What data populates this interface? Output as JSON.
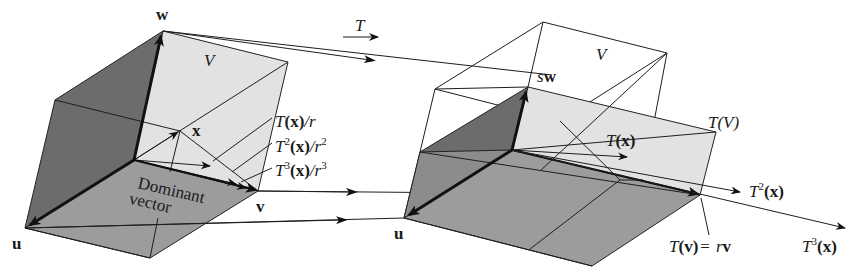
{
  "figure": {
    "colors": {
      "background": "#ffffff",
      "dark_face": "#6e6e6e",
      "mid_face": "#9a9a9a",
      "light_face": "#e4e4e4",
      "line": "#1e1e1e"
    },
    "map_label": "T",
    "left": {
      "region_label": "V",
      "vec_w": "w",
      "vec_u": "u",
      "vec_v": "v",
      "vec_x": "x",
      "dominant_line1": "Dominant",
      "dominant_line2": "vector",
      "iterates": [
        {
          "base": "T",
          "sup": "",
          "arg": "(x)",
          "div": "/r",
          "divsup": ""
        },
        {
          "base": "T",
          "sup": "2",
          "arg": "(x)",
          "div": "/r",
          "divsup": "2"
        },
        {
          "base": "T",
          "sup": "3",
          "arg": "(x)",
          "div": "/r",
          "divsup": "3"
        }
      ]
    },
    "right": {
      "region_label": "V",
      "image_label": "T(V)",
      "vec_sw_s": "s",
      "vec_sw_w": "w",
      "vec_u": "u",
      "tx": {
        "base": "T",
        "arg": "(x)"
      },
      "t2x": {
        "base": "T",
        "sup": "2",
        "arg": "(x)"
      },
      "t3x": {
        "base": "T",
        "sup": "3",
        "arg": "(x)"
      },
      "tv": {
        "lhs_base": "T",
        "lhs_arg": "(v)",
        "eq": "=",
        "rhs_r": "r",
        "rhs_v": "v"
      }
    }
  }
}
